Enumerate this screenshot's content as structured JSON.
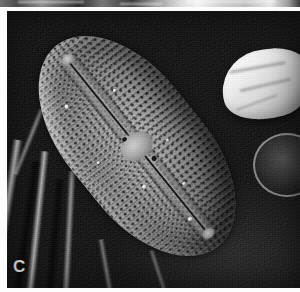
{
  "figure": {
    "panel_label": "C",
    "modality": "scanning-electron-micrograph",
    "color_mode": "grayscale",
    "orientation": "diagonal-upper-left-to-lower-right",
    "canvas": {
      "width": 300,
      "height": 292
    }
  },
  "above_panel": {
    "description": "partial bottom strip of the panel above",
    "visible_height_px": 7
  },
  "specimen": {
    "name": "diatom-frustule",
    "valve_outline": "lanceolate-elliptical",
    "features": [
      {
        "name": "raphe",
        "label": "raphe"
      },
      {
        "name": "central-nodule",
        "label": "central nodule"
      },
      {
        "name": "axial-area",
        "label": "axial area"
      },
      {
        "name": "punctate-striae",
        "label": "punctate striae"
      },
      {
        "name": "polar-nodule",
        "label": "polar nodule"
      }
    ]
  },
  "background": {
    "name": "filter-membrane-substrate",
    "texture": "granular with bright linear folds"
  },
  "debris": [
    {
      "name": "bright-fragment",
      "position": "right-edge-upper"
    },
    {
      "name": "ring-fragment",
      "position": "right-edge-middle"
    }
  ],
  "colors": {
    "paper": "#fdfdfd",
    "background_dark": "#1a1a1a",
    "specimen_mid": "#9e9e9e",
    "highlight": "#ffffff",
    "label_text": "#efefef"
  }
}
